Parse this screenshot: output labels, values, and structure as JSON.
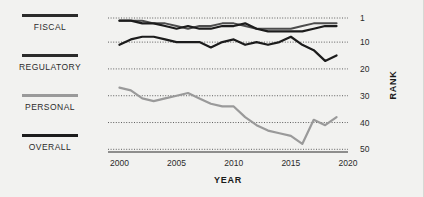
{
  "chart_data": {
    "type": "line",
    "title": "",
    "xlabel": "YEAR",
    "ylabel": "RANK",
    "xlim": [
      1999,
      2020
    ],
    "ylim": [
      1,
      51
    ],
    "y_inverted": true,
    "grid": "horizontal-dotted",
    "legend_position": "left",
    "x_ticks": [
      "2000",
      "2005",
      "2010",
      "2015",
      "2020"
    ],
    "x_tick_values": [
      2000,
      2005,
      2010,
      2015,
      2020
    ],
    "y_ticks": [
      "1",
      "10",
      "20",
      "30",
      "40",
      "50"
    ],
    "y_tick_values": [
      1,
      10,
      20,
      30,
      40,
      50
    ],
    "x": [
      2000,
      2001,
      2002,
      2003,
      2004,
      2005,
      2006,
      2007,
      2008,
      2009,
      2010,
      2011,
      2012,
      2013,
      2014,
      2015,
      2016,
      2017,
      2018,
      2019
    ],
    "series": [
      {
        "name": "FISCAL",
        "color": "#4d4d4d",
        "width": 2.0,
        "values": [
          2,
          2,
          2,
          3,
          3,
          4,
          5,
          4,
          4,
          3,
          3,
          4,
          5,
          5,
          5,
          5,
          4,
          3,
          3,
          3
        ]
      },
      {
        "name": "REGULATORY",
        "color": "#1c1c1c",
        "width": 2.2,
        "values": [
          11,
          9,
          8,
          8,
          9,
          10,
          10,
          10,
          12,
          10,
          9,
          11,
          10,
          11,
          10,
          8,
          11,
          13,
          17,
          15
        ]
      },
      {
        "name": "PERSONAL",
        "color": "#9a9a9a",
        "width": 2.2,
        "values": [
          27,
          28,
          31,
          32,
          31,
          30,
          29,
          31,
          33,
          34,
          34,
          38,
          41,
          43,
          44,
          45,
          48,
          39,
          41,
          38
        ]
      },
      {
        "name": "OVERALL",
        "color": "#1c1c1c",
        "width": 2.2,
        "values": [
          2,
          2,
          3,
          3,
          4,
          5,
          4,
          5,
          5,
          4,
          4,
          3,
          5,
          6,
          6,
          6,
          6,
          5,
          4,
          4
        ]
      }
    ]
  },
  "legend": {
    "items": [
      {
        "label": "FISCAL",
        "color": "#2b2b2b"
      },
      {
        "label": "REGULATORY",
        "color": "#2b2b2b"
      },
      {
        "label": "PERSONAL",
        "color": "#9a9a9a"
      },
      {
        "label": "OVERALL",
        "color": "#1c1c1c"
      }
    ]
  },
  "axes": {
    "x_title": "YEAR",
    "y_title": "RANK"
  }
}
